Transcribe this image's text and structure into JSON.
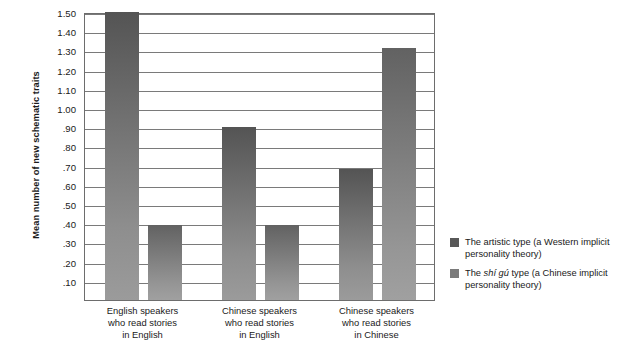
{
  "chart_data": {
    "type": "bar",
    "title": "",
    "subtitle": "",
    "xlabel": "",
    "ylabel": "Mean number of new schematic traits",
    "ylim": [
      0,
      1.5
    ],
    "ytick_labels": [
      "1.50",
      "1.40",
      "1.30",
      "1.20",
      "1.10",
      "1.00",
      ".90",
      ".80",
      ".70",
      ".60",
      ".50",
      ".40",
      ".30",
      ".20",
      ".10"
    ],
    "ytick_values": [
      1.5,
      1.4,
      1.3,
      1.2,
      1.1,
      1.0,
      0.9,
      0.8,
      0.7,
      0.6,
      0.5,
      0.4,
      0.3,
      0.2,
      0.1
    ],
    "grid": true,
    "legend_position": "right",
    "categories": [
      "English speakers who read stories in English",
      "Chinese speakers who read stories in English",
      "Chinese speakers who read stories in Chinese"
    ],
    "category_lines": [
      [
        "English speakers",
        "who read stories",
        "in English"
      ],
      [
        "Chinese speakers",
        "who read stories",
        "in English"
      ],
      [
        "Chinese speakers",
        "who read stories",
        "in Chinese"
      ]
    ],
    "series": [
      {
        "name": "The artistic type (a Western implicit personality theory)",
        "color": "#585858",
        "values": [
          1.5,
          0.9,
          0.68
        ]
      },
      {
        "name": "The shí gú type (a Chinese implicit personality theory)",
        "color": "#7a7a7a",
        "values": [
          0.39,
          0.39,
          1.31
        ]
      }
    ]
  },
  "legend": {
    "entries": [
      {
        "pre": "The artistic type (a Western implicit",
        "italic": "",
        "post": "",
        "line2": "personality theory)"
      },
      {
        "pre": "The ",
        "italic": "shí gú",
        "post": " type (a Chinese implicit",
        "line2": "personality theory)"
      }
    ]
  },
  "axis": {
    "y_title": "Mean number of new schematic traits"
  }
}
